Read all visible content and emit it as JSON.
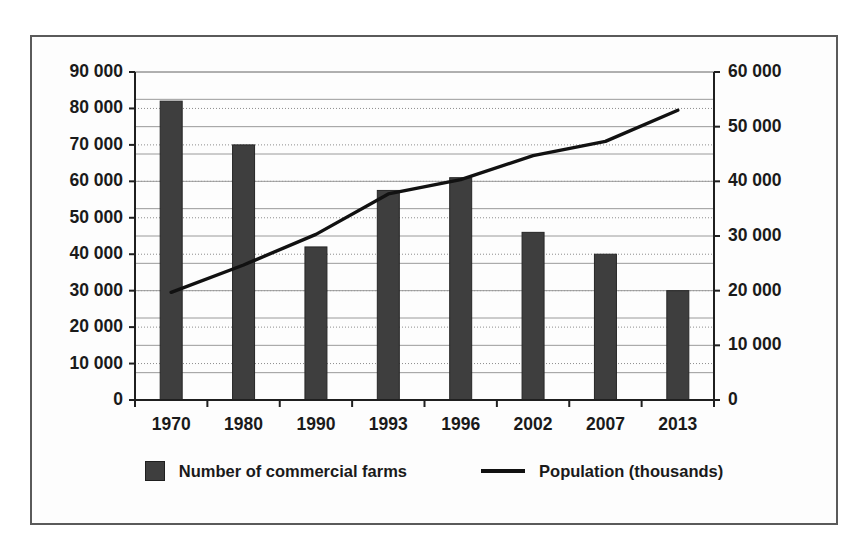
{
  "chart_data": {
    "type": "bar",
    "title": "",
    "subtitle": "",
    "xlabel": "",
    "ylabel": "",
    "categories": [
      "1970",
      "1980",
      "1990",
      "1993",
      "1996",
      "2002",
      "2007",
      "2013"
    ],
    "series": [
      {
        "name": "Number of commercial farms",
        "type": "bar",
        "axis": "left",
        "color": "#3e3e3e",
        "values": [
          82000,
          70000,
          42000,
          57500,
          61000,
          46000,
          40000,
          30000
        ]
      },
      {
        "name": "Population (thousands)",
        "type": "line",
        "axis": "right",
        "color": "#111111",
        "values": [
          19700,
          24700,
          30300,
          37700,
          40300,
          44700,
          47300,
          53000
        ]
      }
    ],
    "left_axis": {
      "min": 0,
      "max": 90000,
      "step": 10000,
      "ticks": [
        "0",
        "10 000",
        "20 000",
        "30 000",
        "40 000",
        "50 000",
        "60 000",
        "70 000",
        "80 000",
        "90 000"
      ]
    },
    "right_axis": {
      "min": 0,
      "max": 60000,
      "step": 10000,
      "minor_step": 5000,
      "ticks": [
        "0",
        "10 000",
        "20 000",
        "30 000",
        "40 000",
        "50 000",
        "60 000"
      ]
    },
    "grid": true,
    "legend_position": "bottom"
  },
  "legend": {
    "bar_label": "Number of commercial farms",
    "line_label": "Population (thousands)"
  }
}
